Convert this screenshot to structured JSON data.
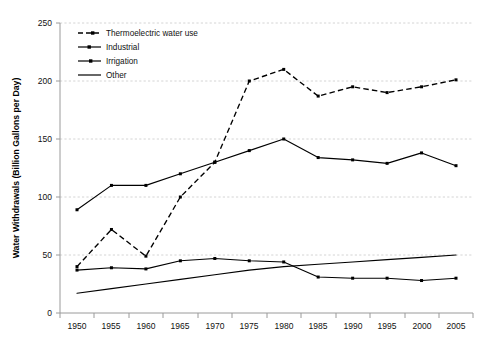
{
  "chart_data": {
    "type": "line",
    "title": "",
    "xlabel": "",
    "ylabel": "Water Withdrawals (Billion Gallons per Day)",
    "categories": [
      1950,
      1955,
      1960,
      1965,
      1970,
      1975,
      1980,
      1985,
      1990,
      1995,
      2000,
      2005
    ],
    "xlim": [
      1947.5,
      2007.5
    ],
    "ylim": [
      0,
      250
    ],
    "yticks": [
      0,
      50,
      100,
      150,
      200,
      250
    ],
    "xticks": [
      1950,
      1955,
      1960,
      1965,
      1970,
      1975,
      1980,
      1985,
      1990,
      1995,
      2000,
      2005
    ],
    "grid": true,
    "legend_position": "top-left-inside",
    "series": [
      {
        "name": "Thermoelectric water use",
        "style": "dashed",
        "markers": true,
        "values": [
          40,
          72,
          49,
          100,
          130,
          200,
          210,
          187,
          195,
          190,
          195,
          201
        ]
      },
      {
        "name": "Industrial",
        "style": "solid",
        "markers": true,
        "values": [
          37,
          39,
          38,
          45,
          47,
          45,
          44,
          31,
          30,
          30,
          28,
          30
        ]
      },
      {
        "name": "Irrigation",
        "style": "solid",
        "markers": true,
        "values": [
          89,
          110,
          110,
          120,
          130,
          140,
          150,
          134,
          132,
          129,
          138,
          127
        ]
      },
      {
        "name": "Other",
        "style": "solid",
        "markers": false,
        "values": [
          17,
          21,
          25,
          29,
          33,
          37,
          40,
          42,
          44,
          46,
          48,
          50
        ]
      }
    ]
  },
  "axis": {
    "y_title": "Water Withdrawals (Billion Gallons per Day)",
    "y_tick_labels": [
      "250",
      "200",
      "150",
      "100",
      "50",
      "0"
    ],
    "x_tick_labels": [
      "1950",
      "1955",
      "1960",
      "1965",
      "1970",
      "1975",
      "1980",
      "1985",
      "1990",
      "1995",
      "2000",
      "2005"
    ]
  },
  "legend": {
    "items": [
      {
        "label": "Thermoelectric water use",
        "style": "dashed",
        "marker": "square"
      },
      {
        "label": "Industrial",
        "style": "solid",
        "marker": "square"
      },
      {
        "label": "Irrigation",
        "style": "solid",
        "marker": "square"
      },
      {
        "label": "Other",
        "style": "solid",
        "marker": "none"
      }
    ]
  },
  "colors": {
    "line": "#000000",
    "grid": "#c9c9c9",
    "axis": "#9a9a9a",
    "background": "#ffffff",
    "text": "#111111"
  }
}
